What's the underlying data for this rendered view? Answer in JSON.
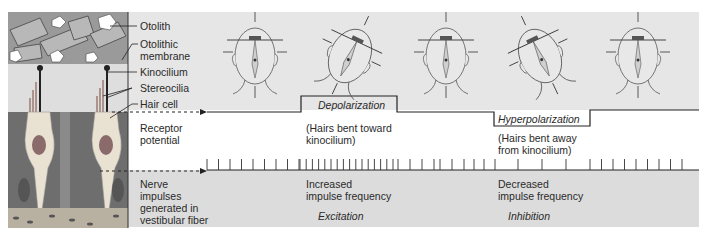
{
  "illustration": {
    "labels": [
      {
        "id": "otolith",
        "text": "Otolith"
      },
      {
        "id": "otolithic-membrane",
        "text": "Otolithic membrane"
      },
      {
        "id": "kinocilium",
        "text": "Kinocilium"
      },
      {
        "id": "stereocilia",
        "text": "Stereocilia"
      },
      {
        "id": "hair-cell",
        "text": "Hair cell"
      }
    ]
  },
  "rows": {
    "receptor": {
      "label_line1": "Receptor",
      "label_line2": "potential"
    },
    "nerve": {
      "label_line1": "Nerve",
      "label_line2": "impulses",
      "label_line3": "generated in",
      "label_line4": "vestibular fiber"
    }
  },
  "states": {
    "depolarization": {
      "title": "Depolarization",
      "note_line1": "(Hairs bent toward",
      "note_line2": "kinocilium)",
      "freq_line1": "Increased",
      "freq_line2": "impulse frequency",
      "effect": "Excitation"
    },
    "hyperpolarization": {
      "title": "Hyperpolarization",
      "note_line1": "(Hairs bent away",
      "note_line2": "from kinocilium)",
      "freq_line1": "Decreased",
      "freq_line2": "impulse frequency",
      "effect": "Inhibition"
    }
  },
  "heads": [
    {
      "position": "upright",
      "tilt_deg": 0
    },
    {
      "position": "tilted-forward",
      "tilt_deg": 25
    },
    {
      "position": "upright",
      "tilt_deg": 0
    },
    {
      "position": "tilted-back",
      "tilt_deg": -25
    },
    {
      "position": "upright",
      "tilt_deg": 0
    }
  ],
  "colors": {
    "band_top": "#e6e6e6",
    "band_bottom": "#dcdcdc",
    "line": "#333333",
    "tissue_dark": "#6e6e6e",
    "tissue_light": "#cfcfcf",
    "cell": "#e9e2d3"
  }
}
